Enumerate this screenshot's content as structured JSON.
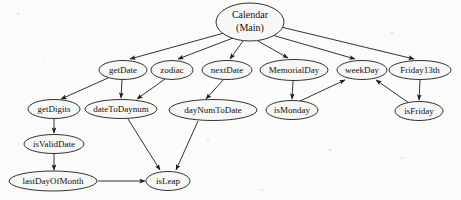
{
  "diagram": {
    "type": "call-graph",
    "background_color": "#fbfbf9",
    "node_fill_color": "#f7f7f5",
    "node_stroke_color": "#1c1c1c",
    "edge_color": "#1c1c1c",
    "nodes": [
      {
        "id": "calendar",
        "label": "Calendar",
        "label2": "(Main)",
        "cx": 250,
        "cy": 22,
        "rx": 34,
        "ry": 19,
        "font_size": 10,
        "two_line": true
      },
      {
        "id": "getDate",
        "label": "getDate",
        "cx": 123,
        "cy": 70,
        "rx": 24,
        "ry": 9.5,
        "font_size": 9
      },
      {
        "id": "zodiac",
        "label": "zodiac",
        "cx": 172,
        "cy": 70,
        "rx": 21,
        "ry": 9.5,
        "font_size": 9
      },
      {
        "id": "nextDate",
        "label": "nextDate",
        "cx": 227,
        "cy": 70,
        "rx": 25,
        "ry": 9.5,
        "font_size": 9
      },
      {
        "id": "MemorialDay",
        "label": "MemorialDay",
        "cx": 294,
        "cy": 70,
        "rx": 34,
        "ry": 10.5,
        "font_size": 9
      },
      {
        "id": "weekDay",
        "label": "weekDay",
        "cx": 362,
        "cy": 70,
        "rx": 25,
        "ry": 9.5,
        "font_size": 9
      },
      {
        "id": "Friday13th",
        "label": "Friday13th",
        "cx": 420,
        "cy": 70,
        "rx": 31,
        "ry": 9.5,
        "font_size": 9
      },
      {
        "id": "getDigits",
        "label": "getDigits",
        "cx": 54,
        "cy": 109,
        "rx": 26,
        "ry": 9.5,
        "font_size": 9
      },
      {
        "id": "dateToDaynum",
        "label": "dateToDaynum",
        "cx": 121,
        "cy": 109,
        "rx": 36,
        "ry": 9.5,
        "font_size": 9
      },
      {
        "id": "dayNumToDate",
        "label": "dayNumToDate",
        "cx": 213,
        "cy": 110,
        "rx": 44,
        "ry": 10.5,
        "font_size": 9
      },
      {
        "id": "isMonday",
        "label": "isMonday",
        "cx": 292,
        "cy": 110,
        "rx": 26,
        "ry": 9.5,
        "font_size": 9
      },
      {
        "id": "isFriday",
        "label": "isFriday",
        "cx": 419,
        "cy": 111,
        "rx": 24,
        "ry": 9.5,
        "font_size": 9
      },
      {
        "id": "isValidDate",
        "label": "isValidDate",
        "cx": 54,
        "cy": 144,
        "rx": 30,
        "ry": 9.5,
        "font_size": 9
      },
      {
        "id": "lastDayOfMonth",
        "label": "lastDayOfMonth",
        "cx": 53,
        "cy": 181,
        "rx": 44,
        "ry": 10,
        "font_size": 9
      },
      {
        "id": "isLeap",
        "label": "isLeap",
        "cx": 168,
        "cy": 181,
        "rx": 22,
        "ry": 9.5,
        "font_size": 9
      }
    ],
    "edges": [
      {
        "from": "calendar",
        "to": "getDate",
        "x1": 224,
        "y1": 33,
        "x2": 130,
        "y2": 59
      },
      {
        "from": "calendar",
        "to": "zodiac",
        "x1": 233,
        "y1": 38,
        "x2": 178,
        "y2": 59
      },
      {
        "from": "calendar",
        "to": "nextDate",
        "x1": 243,
        "y1": 41,
        "x2": 230,
        "y2": 59
      },
      {
        "from": "calendar",
        "to": "MemorialDay",
        "x1": 258,
        "y1": 41,
        "x2": 288,
        "y2": 58
      },
      {
        "from": "calendar",
        "to": "weekDay",
        "x1": 272,
        "y1": 35,
        "x2": 355,
        "y2": 59
      },
      {
        "from": "calendar",
        "to": "Friday13th",
        "x1": 281,
        "y1": 27,
        "x2": 414,
        "y2": 59
      },
      {
        "from": "getDate",
        "to": "getDigits",
        "x1": 108,
        "y1": 78,
        "x2": 61,
        "y2": 99
      },
      {
        "from": "getDate",
        "to": "dateToDaynum",
        "x1": 122,
        "y1": 80,
        "x2": 121,
        "y2": 98
      },
      {
        "from": "zodiac",
        "to": "dateToDaynum",
        "x1": 165,
        "y1": 79,
        "x2": 137,
        "y2": 99
      },
      {
        "from": "nextDate",
        "to": "dayNumToDate",
        "x1": 223,
        "y1": 80,
        "x2": 206,
        "y2": 99
      },
      {
        "from": "MemorialDay",
        "to": "isMonday",
        "x1": 293,
        "y1": 81,
        "x2": 292,
        "y2": 99
      },
      {
        "from": "isMonday",
        "to": "weekDay",
        "x1": 300,
        "y1": 101,
        "x2": 345,
        "y2": 80
      },
      {
        "from": "Friday13th",
        "to": "isFriday",
        "x1": 420,
        "y1": 80,
        "x2": 419,
        "y2": 100
      },
      {
        "from": "isFriday",
        "to": "weekDay",
        "x1": 409,
        "y1": 103,
        "x2": 376,
        "y2": 80
      },
      {
        "from": "getDigits",
        "to": "isValidDate",
        "x1": 54,
        "y1": 119,
        "x2": 54,
        "y2": 133
      },
      {
        "from": "isValidDate",
        "to": "lastDayOfMonth",
        "x1": 54,
        "y1": 154,
        "x2": 54,
        "y2": 170
      },
      {
        "from": "lastDayOfMonth",
        "to": "isLeap",
        "x1": 98,
        "y1": 181,
        "x2": 145,
        "y2": 181
      },
      {
        "from": "dateToDaynum",
        "to": "isLeap",
        "x1": 128,
        "y1": 119,
        "x2": 160,
        "y2": 170
      },
      {
        "from": "dayNumToDate",
        "to": "isLeap",
        "x1": 198,
        "y1": 121,
        "x2": 176,
        "y2": 170
      }
    ]
  },
  "caption": {
    "text": ""
  }
}
